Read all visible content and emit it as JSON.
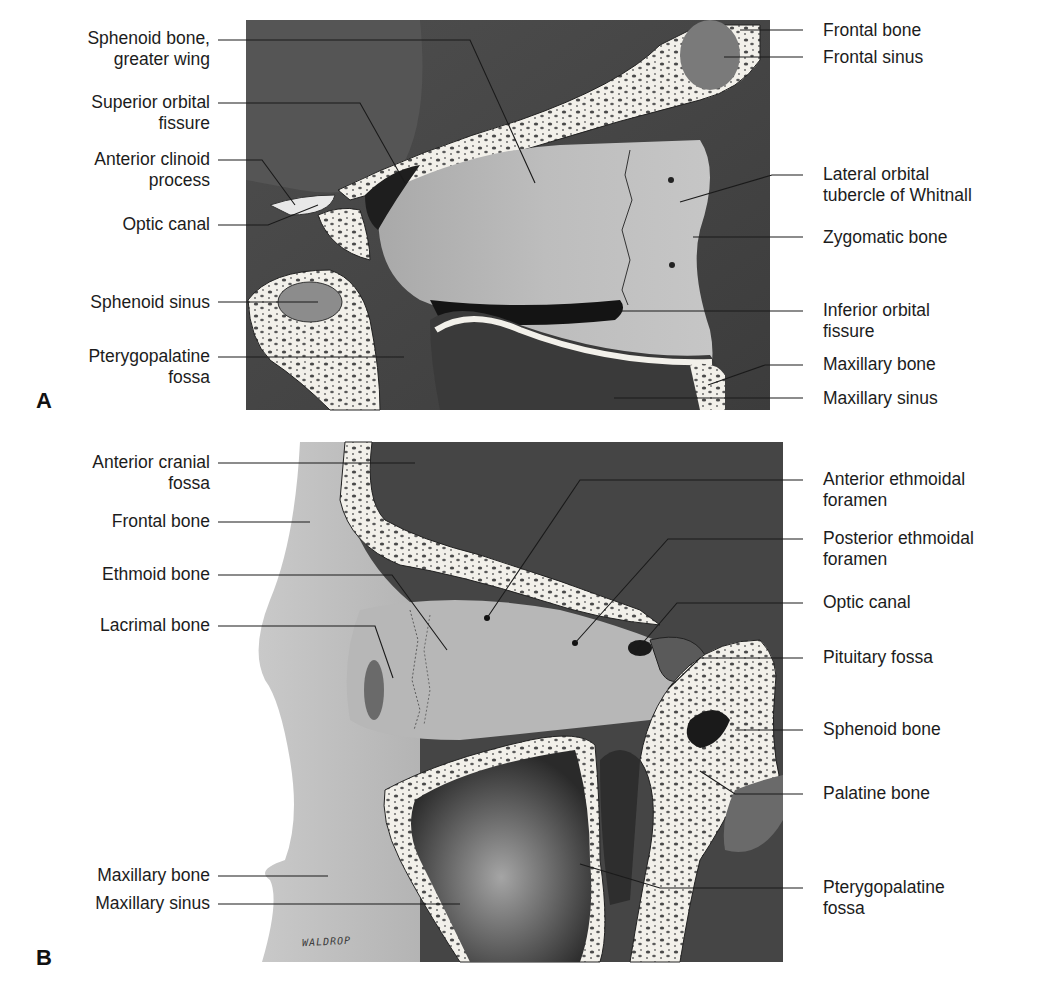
{
  "figure": {
    "panels": [
      {
        "letter": "A",
        "left_labels": [
          {
            "line1": "Sphenoid bone,",
            "line2": "greater wing"
          },
          {
            "line1": "Superior orbital",
            "line2": "fissure"
          },
          {
            "line1": "Anterior clinoid",
            "line2": "process"
          },
          {
            "line1": "Optic canal",
            "line2": ""
          },
          {
            "line1": "Sphenoid sinus",
            "line2": ""
          },
          {
            "line1": "Pterygopalatine",
            "line2": "fossa"
          }
        ],
        "right_labels": [
          {
            "line1": "Frontal bone",
            "line2": ""
          },
          {
            "line1": "Frontal sinus",
            "line2": ""
          },
          {
            "line1": "Lateral orbital",
            "line2": "tubercle of Whitnall"
          },
          {
            "line1": "Zygomatic bone",
            "line2": ""
          },
          {
            "line1": "Inferior orbital",
            "line2": "fissure"
          },
          {
            "line1": "Maxillary bone",
            "line2": ""
          },
          {
            "line1": "Maxillary sinus",
            "line2": ""
          }
        ]
      },
      {
        "letter": "B",
        "left_labels": [
          {
            "line1": "Anterior cranial",
            "line2": "fossa"
          },
          {
            "line1": "Frontal bone",
            "line2": ""
          },
          {
            "line1": "Ethmoid bone",
            "line2": ""
          },
          {
            "line1": "Lacrimal bone",
            "line2": ""
          },
          {
            "line1": "Maxillary bone",
            "line2": ""
          },
          {
            "line1": "Maxillary sinus",
            "line2": ""
          }
        ],
        "right_labels": [
          {
            "line1": "Anterior ethmoidal",
            "line2": "foramen"
          },
          {
            "line1": "Posterior ethmoidal",
            "line2": "foramen"
          },
          {
            "line1": "Optic canal",
            "line2": ""
          },
          {
            "line1": "Pituitary fossa",
            "line2": ""
          },
          {
            "line1": "Sphenoid bone",
            "line2": ""
          },
          {
            "line1": "Palatine bone",
            "line2": ""
          },
          {
            "line1": "Pterygopalatine",
            "line2": "fossa"
          }
        ],
        "signature": "WALDROP"
      }
    ]
  }
}
